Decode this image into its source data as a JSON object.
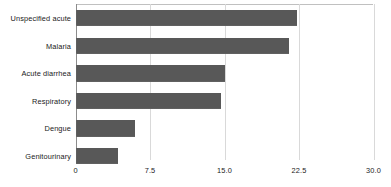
{
  "chart_data": {
    "type": "bar",
    "orientation": "horizontal",
    "title": "",
    "subtitle": "",
    "xlabel": "",
    "ylabel": "",
    "categories": [
      "Unspecified acute",
      "Malaria",
      "Acute diarrhea",
      "Respiratory",
      "Dengue",
      "Genitourinary"
    ],
    "values": [
      22.3,
      21.5,
      15.0,
      14.6,
      6.0,
      4.3
    ],
    "xlim": [
      0,
      30
    ],
    "xticks": [
      0,
      7.5,
      15,
      22.5,
      30
    ],
    "xtick_labels": [
      "0",
      "7.5",
      "15.0",
      "22.5",
      "30.0"
    ],
    "grid": "vertical",
    "legend": "none",
    "series": [
      {
        "name": "",
        "color": "#585858",
        "values": [
          22.3,
          21.5,
          15.0,
          14.6,
          6.0,
          4.3
        ]
      }
    ],
    "annotations": []
  },
  "colors": {
    "bar": "#585858",
    "gridline": "#d9d9d9",
    "axis": "#8c8c8c",
    "text": "#1a1a1a",
    "background": "#ffffff"
  }
}
